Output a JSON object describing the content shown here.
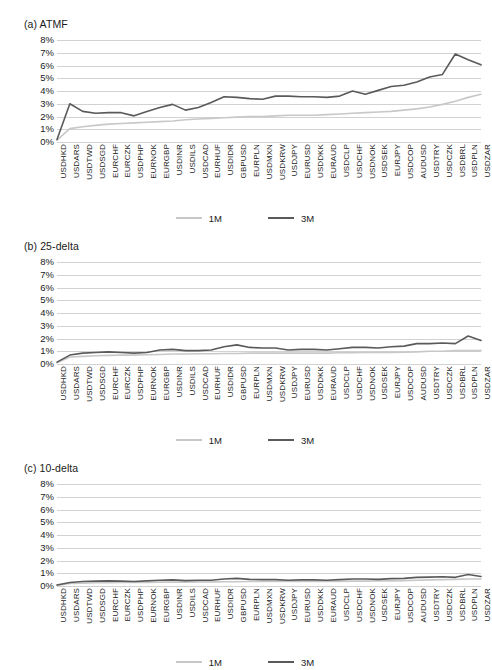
{
  "figure": {
    "panels": [
      {
        "id": "a",
        "title": "(a) ATMF"
      },
      {
        "id": "b",
        "title": "(b) 25-delta"
      },
      {
        "id": "c",
        "title": "(c) 10-delta"
      }
    ],
    "legend": [
      {
        "label": "1M",
        "color": "#c8c8c8"
      },
      {
        "label": "3M",
        "color": "#5a5a5a"
      }
    ],
    "colors": {
      "series_1m": "#c8c8c8",
      "series_3m": "#5a5a5a",
      "gridline": "#d2d2d2",
      "text": "#1a1a1a",
      "background": "#ffffff"
    },
    "yticks": [
      "0%",
      "1%",
      "2%",
      "3%",
      "4%",
      "5%",
      "6%",
      "7%",
      "8%"
    ]
  },
  "chart_data": [
    {
      "type": "line",
      "title": "(a) ATMF",
      "xlabel": "",
      "ylabel": "",
      "ylim": [
        0,
        8
      ],
      "ytick_values": [
        0,
        1,
        2,
        3,
        4,
        5,
        6,
        7,
        8
      ],
      "ytick_labels": [
        "0%",
        "1%",
        "2%",
        "3%",
        "4%",
        "5%",
        "6%",
        "7%",
        "8%"
      ],
      "grid": true,
      "legend_position": "bottom",
      "categories": [
        "USDHKD",
        "USDARS",
        "USDTWD",
        "USDSGD",
        "EURCHF",
        "EURCZK",
        "USDPHP",
        "EURNOK",
        "EURGBP",
        "USDINR",
        "USDILS",
        "USDCAD",
        "EURHUF",
        "USDIDR",
        "GBPUSD",
        "EURPLN",
        "USDMXN",
        "USDKRW",
        "USDJPY",
        "EURUSD",
        "USDDKK",
        "EURAUD",
        "USDCLP",
        "USDCHF",
        "USDNOK",
        "USDSEK",
        "EURJPY",
        "USDCOP",
        "AUDUSD",
        "USDTRY",
        "USDCZK",
        "USDBRL",
        "USDPLN",
        "USDZAR"
      ],
      "series": [
        {
          "name": "1M",
          "color": "#c8c8c8",
          "values": [
            0.15,
            1.05,
            1.2,
            1.3,
            1.4,
            1.45,
            1.5,
            1.55,
            1.6,
            1.65,
            1.75,
            1.8,
            1.85,
            1.9,
            1.95,
            2.0,
            2.0,
            2.05,
            2.1,
            2.1,
            2.1,
            2.15,
            2.2,
            2.25,
            2.3,
            2.35,
            2.4,
            2.5,
            2.6,
            2.75,
            2.95,
            3.2,
            3.5,
            3.75
          ]
        },
        {
          "name": "3M",
          "color": "#5a5a5a",
          "values": [
            0.2,
            3.0,
            2.4,
            2.25,
            2.3,
            2.3,
            2.05,
            2.4,
            2.7,
            2.95,
            2.5,
            2.7,
            3.1,
            3.55,
            3.5,
            3.4,
            3.35,
            3.6,
            3.6,
            3.55,
            3.55,
            3.5,
            3.6,
            4.0,
            3.75,
            4.05,
            4.35,
            4.45,
            4.7,
            5.1,
            5.3,
            6.9,
            6.45,
            6.05
          ]
        }
      ]
    },
    {
      "type": "line",
      "title": "(b) 25-delta",
      "xlabel": "",
      "ylabel": "",
      "ylim": [
        0,
        8
      ],
      "ytick_values": [
        0,
        1,
        2,
        3,
        4,
        5,
        6,
        7,
        8
      ],
      "ytick_labels": [
        "0%",
        "1%",
        "2%",
        "3%",
        "4%",
        "5%",
        "6%",
        "7%",
        "8%"
      ],
      "grid": true,
      "legend_position": "bottom",
      "categories": [
        "USDHKD",
        "USDARS",
        "USDTWD",
        "USDSGD",
        "EURCHF",
        "EURCZK",
        "USDPHP",
        "EURNOK",
        "EURGBP",
        "USDINR",
        "USDILS",
        "USDCAD",
        "EURHUF",
        "USDIDR",
        "GBPUSD",
        "EURPLN",
        "USDMXN",
        "USDKRW",
        "USDJPY",
        "EURUSD",
        "USDDKK",
        "EURAUD",
        "USDCLP",
        "USDCHF",
        "USDNOK",
        "USDSEK",
        "EURJPY",
        "USDCOP",
        "AUDUSD",
        "USDTRY",
        "USDCZK",
        "USDBRL",
        "USDPLN",
        "USDZAR"
      ],
      "series": [
        {
          "name": "1M",
          "color": "#c8c8c8",
          "values": [
            0.1,
            0.55,
            0.6,
            0.65,
            0.68,
            0.7,
            0.7,
            0.72,
            0.75,
            0.78,
            0.78,
            0.8,
            0.8,
            0.82,
            0.82,
            0.85,
            0.85,
            0.85,
            0.85,
            0.85,
            0.85,
            0.85,
            0.88,
            0.88,
            0.9,
            0.9,
            0.9,
            0.92,
            0.95,
            1.0,
            1.0,
            1.05,
            1.05,
            1.05
          ]
        },
        {
          "name": "3M",
          "color": "#5a5a5a",
          "values": [
            0.15,
            0.7,
            0.85,
            0.9,
            0.95,
            0.9,
            0.85,
            0.9,
            1.1,
            1.15,
            1.05,
            1.05,
            1.1,
            1.35,
            1.5,
            1.3,
            1.25,
            1.25,
            1.1,
            1.15,
            1.15,
            1.1,
            1.2,
            1.3,
            1.3,
            1.25,
            1.35,
            1.4,
            1.6,
            1.6,
            1.65,
            1.6,
            2.2,
            1.85
          ]
        }
      ]
    },
    {
      "type": "line",
      "title": "(c) 10-delta",
      "xlabel": "",
      "ylabel": "",
      "ylim": [
        0,
        8
      ],
      "ytick_values": [
        0,
        1,
        2,
        3,
        4,
        5,
        6,
        7,
        8
      ],
      "ytick_labels": [
        "0%",
        "1%",
        "2%",
        "3%",
        "4%",
        "5%",
        "6%",
        "7%",
        "8%"
      ],
      "grid": true,
      "legend_position": "bottom",
      "categories": [
        "USDHKD",
        "USDARS",
        "USDTWD",
        "USDSGD",
        "EURCHF",
        "EURCZK",
        "USDPHP",
        "EURNOK",
        "EURGBP",
        "USDINR",
        "USDILS",
        "USDCAD",
        "EURHUF",
        "USDIDR",
        "GBPUSD",
        "EURPLN",
        "USDMXN",
        "USDKRW",
        "USDJPY",
        "EURUSD",
        "USDDKK",
        "EURAUD",
        "USDCLP",
        "USDCHF",
        "USDNOK",
        "USDSEK",
        "EURJPY",
        "USDCOP",
        "AUDUSD",
        "USDTRY",
        "USDCZK",
        "USDBRL",
        "USDPLN",
        "USDZAR"
      ],
      "series": [
        {
          "name": "1M",
          "color": "#c8c8c8",
          "values": [
            0.05,
            0.2,
            0.22,
            0.25,
            0.25,
            0.27,
            0.27,
            0.28,
            0.3,
            0.3,
            0.3,
            0.32,
            0.32,
            0.33,
            0.33,
            0.35,
            0.35,
            0.35,
            0.35,
            0.35,
            0.35,
            0.35,
            0.36,
            0.38,
            0.38,
            0.4,
            0.4,
            0.42,
            0.45,
            0.48,
            0.5,
            0.52,
            0.55,
            0.55
          ]
        },
        {
          "name": "3M",
          "color": "#5a5a5a",
          "values": [
            0.08,
            0.28,
            0.35,
            0.38,
            0.4,
            0.38,
            0.35,
            0.4,
            0.45,
            0.48,
            0.42,
            0.45,
            0.45,
            0.55,
            0.6,
            0.52,
            0.5,
            0.5,
            0.45,
            0.48,
            0.48,
            0.45,
            0.5,
            0.55,
            0.55,
            0.52,
            0.58,
            0.6,
            0.68,
            0.7,
            0.72,
            0.68,
            0.9,
            0.75
          ]
        }
      ]
    }
  ]
}
